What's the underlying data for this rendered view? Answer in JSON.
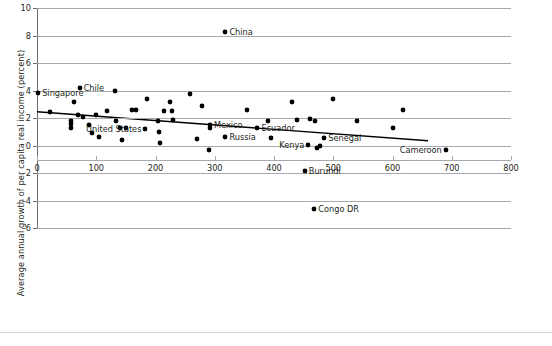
{
  "chart_data": {
    "type": "scatter",
    "title": "",
    "xlabel": "",
    "ylabel": "Average annual growth of per capita real income (percent)",
    "xlim": [
      0,
      800
    ],
    "ylim": [
      -6,
      10
    ],
    "xticks": [
      0,
      100,
      200,
      300,
      400,
      500,
      600,
      700,
      800
    ],
    "yticks": [
      -6,
      -4,
      -2,
      0,
      2,
      4,
      6,
      8,
      10
    ],
    "grid": "horizontal",
    "legend": "none",
    "marker_color": "#000000",
    "gridline_color": "#a7a9ac",
    "trendline": {
      "label": "linear fit",
      "color": "#000000",
      "x_start": 0,
      "y_start": 2.45,
      "x_end": 660,
      "y_end": 0.35
    },
    "labeled_points": [
      {
        "label": "Singapore",
        "x": 2,
        "y": 3.85,
        "label_side": "right"
      },
      {
        "label": "Chile",
        "x": 72,
        "y": 4.2,
        "label_side": "right"
      },
      {
        "label": "China",
        "x": 318,
        "y": 8.25,
        "label_side": "right"
      },
      {
        "label": "United States",
        "x": 183,
        "y": 1.2,
        "label_side": "left"
      },
      {
        "label": "Mexico",
        "x": 292,
        "y": 1.5,
        "label_side": "right"
      },
      {
        "label": "Ecuador",
        "x": 372,
        "y": 1.3,
        "label_side": "right"
      },
      {
        "label": "Russia",
        "x": 318,
        "y": 0.6,
        "label_side": "right"
      },
      {
        "label": "Kenya",
        "x": 458,
        "y": 0.05,
        "label_side": "left"
      },
      {
        "label": "Senegal",
        "x": 485,
        "y": 0.55,
        "label_side": "right"
      },
      {
        "label": "Cameroon",
        "x": 690,
        "y": -0.35,
        "label_side": "left"
      },
      {
        "label": "Burundi",
        "x": 452,
        "y": -1.85,
        "label_side": "right"
      },
      {
        "label": "Congo DR",
        "x": 468,
        "y": -4.65,
        "label_side": "right"
      }
    ],
    "unlabeled_points": [
      {
        "x": 22,
        "y": 2.45
      },
      {
        "x": 58,
        "y": 1.75
      },
      {
        "x": 58,
        "y": 1.6
      },
      {
        "x": 58,
        "y": 1.3
      },
      {
        "x": 62,
        "y": 3.2
      },
      {
        "x": 70,
        "y": 2.2
      },
      {
        "x": 78,
        "y": 2.1
      },
      {
        "x": 88,
        "y": 1.5
      },
      {
        "x": 92,
        "y": 0.9
      },
      {
        "x": 100,
        "y": 2.2
      },
      {
        "x": 104,
        "y": 0.65
      },
      {
        "x": 118,
        "y": 2.5
      },
      {
        "x": 132,
        "y": 3.95
      },
      {
        "x": 134,
        "y": 1.8
      },
      {
        "x": 140,
        "y": 1.25
      },
      {
        "x": 143,
        "y": 0.4
      },
      {
        "x": 150,
        "y": 1.25
      },
      {
        "x": 160,
        "y": 2.55
      },
      {
        "x": 167,
        "y": 2.6
      },
      {
        "x": 186,
        "y": 3.4
      },
      {
        "x": 205,
        "y": 1.75
      },
      {
        "x": 206,
        "y": 0.95
      },
      {
        "x": 208,
        "y": 0.2
      },
      {
        "x": 214,
        "y": 2.5
      },
      {
        "x": 225,
        "y": 3.2
      },
      {
        "x": 228,
        "y": 2.5
      },
      {
        "x": 230,
        "y": 1.85
      },
      {
        "x": 258,
        "y": 3.75
      },
      {
        "x": 270,
        "y": 0.5
      },
      {
        "x": 278,
        "y": 2.9
      },
      {
        "x": 290,
        "y": -0.35
      },
      {
        "x": 292,
        "y": 1.3
      },
      {
        "x": 355,
        "y": 2.6
      },
      {
        "x": 390,
        "y": 1.75
      },
      {
        "x": 395,
        "y": 0.55
      },
      {
        "x": 430,
        "y": 3.2
      },
      {
        "x": 438,
        "y": 1.85
      },
      {
        "x": 460,
        "y": 1.9
      },
      {
        "x": 470,
        "y": 1.8
      },
      {
        "x": 472,
        "y": -0.2
      },
      {
        "x": 478,
        "y": 0.0
      },
      {
        "x": 500,
        "y": 3.4
      },
      {
        "x": 540,
        "y": 1.8
      },
      {
        "x": 600,
        "y": 1.3
      },
      {
        "x": 618,
        "y": 2.6
      }
    ]
  }
}
